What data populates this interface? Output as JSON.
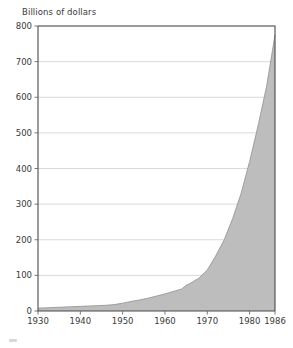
{
  "figure": {
    "name": "area-chart-figure",
    "background": "#ffffff"
  },
  "axis_label": {
    "y_title": "Billions of dollars"
  },
  "colors": {
    "area_fill": "#bdbdbd",
    "area_stroke": "#8f8f8f",
    "gridline": "#c9c9c9",
    "axis": "#4a4a4a",
    "text": "#3a3a3a"
  },
  "chart_data": {
    "type": "area",
    "title": "",
    "subtitle": "",
    "xlabel": "",
    "ylabel": "Billions of dollars",
    "xlim": [
      1930,
      1986
    ],
    "ylim": [
      0,
      800
    ],
    "grid": true,
    "legend": "none",
    "ytick_labels": [
      "0",
      "100",
      "200",
      "300",
      "400",
      "500",
      "600",
      "700",
      "800"
    ],
    "ytick_values": [
      0,
      100,
      200,
      300,
      400,
      500,
      600,
      700,
      800
    ],
    "xtick_labels": [
      "1930",
      "1940",
      "1950",
      "1960",
      "1970",
      "1980",
      "1986"
    ],
    "xtick_values": [
      1930,
      1940,
      1950,
      1960,
      1970,
      1980,
      1986
    ],
    "x": [
      1930,
      1932,
      1934,
      1936,
      1938,
      1940,
      1942,
      1944,
      1946,
      1948,
      1950,
      1952,
      1954,
      1956,
      1958,
      1960,
      1962,
      1964,
      1965,
      1966,
      1968,
      1970,
      1972,
      1974,
      1976,
      1978,
      1980,
      1982,
      1984,
      1986
    ],
    "values": [
      8,
      9,
      10,
      11,
      12,
      13,
      14,
      15,
      16,
      18,
      22,
      27,
      31,
      36,
      42,
      48,
      55,
      62,
      72,
      78,
      92,
      115,
      155,
      200,
      260,
      330,
      420,
      520,
      630,
      775
    ],
    "series": [
      {
        "name": "Billions of dollars",
        "values": [
          8,
          9,
          10,
          11,
          12,
          13,
          14,
          15,
          16,
          18,
          22,
          27,
          31,
          36,
          42,
          48,
          55,
          62,
          72,
          78,
          92,
          115,
          155,
          200,
          260,
          330,
          420,
          520,
          630,
          775
        ]
      }
    ],
    "annotations": []
  }
}
